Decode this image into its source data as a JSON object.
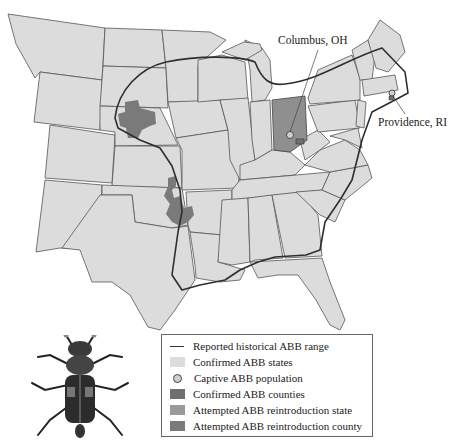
{
  "map": {
    "title": "American burying beetle (ABB) range map",
    "labels": {
      "columbus": "Columbus, OH",
      "providence": "Providence, RI"
    },
    "colors": {
      "state_fill": "#dcdcdc",
      "county_fill": "#7a7a7a",
      "reintro_state_fill": "#8f8f8f",
      "range_line": "#2e2e2e",
      "border": "#555555"
    }
  },
  "legend": {
    "items": [
      {
        "symbol": "line",
        "label": "Reported historical ABB range"
      },
      {
        "symbol": "light-square",
        "label": "Confirmed ABB states"
      },
      {
        "symbol": "circle",
        "label": "Captive ABB population"
      },
      {
        "symbol": "dark-square",
        "label": "Confirmed ABB counties"
      },
      {
        "symbol": "medium-square",
        "label": "Attempted ABB reintroduction state"
      },
      {
        "symbol": "dark-square",
        "label": "Attempted ABB reintroduction county"
      }
    ]
  },
  "illustration": {
    "name": "american-burying-beetle"
  }
}
